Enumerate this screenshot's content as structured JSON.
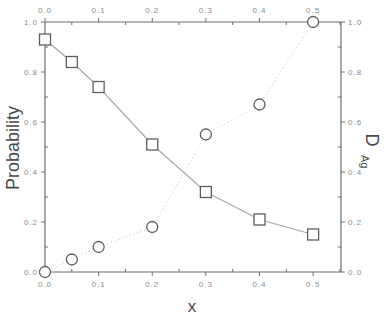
{
  "chart_data": {
    "type": "line",
    "title": "",
    "xlabel": "x",
    "ylabel": "Probability",
    "y2label": "D",
    "y2label_sub": "Ag",
    "xlim": [
      0.0,
      0.552
    ],
    "ylim": [
      0.0,
      1.0
    ],
    "y2lim": [
      0.0,
      1.0
    ],
    "grid": false,
    "legend": null,
    "x_ticks": [
      "0.0",
      "0.1",
      "0.2",
      "0.3",
      "0.4",
      "0.5"
    ],
    "x_tick_values": [
      0.0,
      0.1,
      0.2,
      0.3,
      0.4,
      0.5
    ],
    "y_ticks": [
      "0.0",
      "0.2",
      "0.4",
      "0.6",
      "0.8",
      "1.0"
    ],
    "y_tick_values": [
      0.0,
      0.2,
      0.4,
      0.6,
      0.8,
      1.0
    ],
    "y2_ticks": [
      "0.0",
      "0.2",
      "0.4",
      "0.6",
      "0.8",
      "1.0"
    ],
    "series": [
      {
        "name": "Probability",
        "axis": "left",
        "marker": "square",
        "line": "solid",
        "color": "#7a7a7a",
        "x": [
          0.0,
          0.05,
          0.1,
          0.2,
          0.3,
          0.4,
          0.5
        ],
        "values": [
          0.93,
          0.84,
          0.74,
          0.51,
          0.32,
          0.21,
          0.15
        ]
      },
      {
        "name": "D_Ag",
        "axis": "right",
        "marker": "circle",
        "line": "dotted",
        "color": "#7a7a7a",
        "x": [
          0.0,
          0.05,
          0.1,
          0.2,
          0.3,
          0.4,
          0.5
        ],
        "values": [
          0.0,
          0.05,
          0.1,
          0.18,
          0.55,
          0.67,
          1.0
        ]
      }
    ]
  },
  "colors": {
    "axis": "#6e6e6e",
    "marker": "#5e5e5e",
    "line": "#a8a8a8",
    "dotted": "#d4d4d4",
    "tick_label": "#8a8a8a"
  }
}
